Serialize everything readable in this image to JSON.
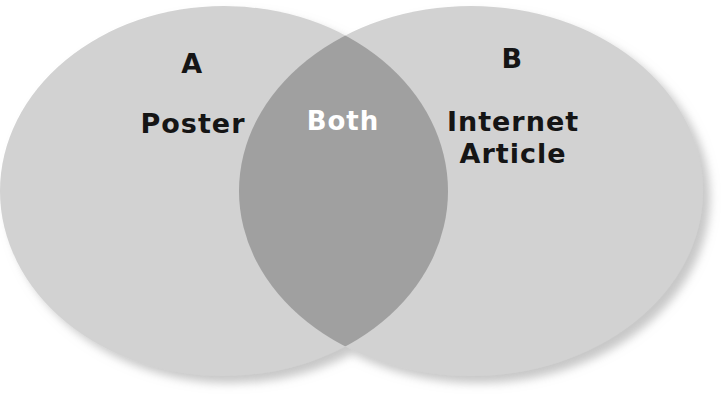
{
  "diagram": {
    "type": "venn-diagram",
    "canvas": {
      "width": 724,
      "height": 395,
      "background_color": "#ffffff"
    },
    "colors": {
      "circle_fill": "#d2d2d2",
      "overlap_fill": "#a0a0a0",
      "shadow": "#bdbdbd",
      "label_text": "#151515",
      "overlap_text": "#ffffff"
    },
    "sets": [
      {
        "key": "A",
        "letter": "A",
        "name": "Poster",
        "side": "left",
        "cx": 224,
        "cy": 191,
        "rx": 224,
        "ry": 185,
        "fill": "#d2d2d2"
      },
      {
        "key": "B",
        "letter": "B",
        "name": "Internet\nArticle",
        "name_line1": "Internet",
        "name_line2": "Article",
        "side": "right",
        "cx": 471,
        "cy": 191,
        "rx": 232,
        "ry": 185,
        "fill": "#d2d2d2"
      }
    ],
    "intersection": {
      "label": "Both",
      "fill": "#a0a0a0",
      "text_color": "#ffffff",
      "lens_left_x": 239,
      "lens_right_x": 448,
      "lens_top_cusp_y": 42,
      "lens_bottom_cusp_y": 348,
      "center_x": 343
    }
  }
}
